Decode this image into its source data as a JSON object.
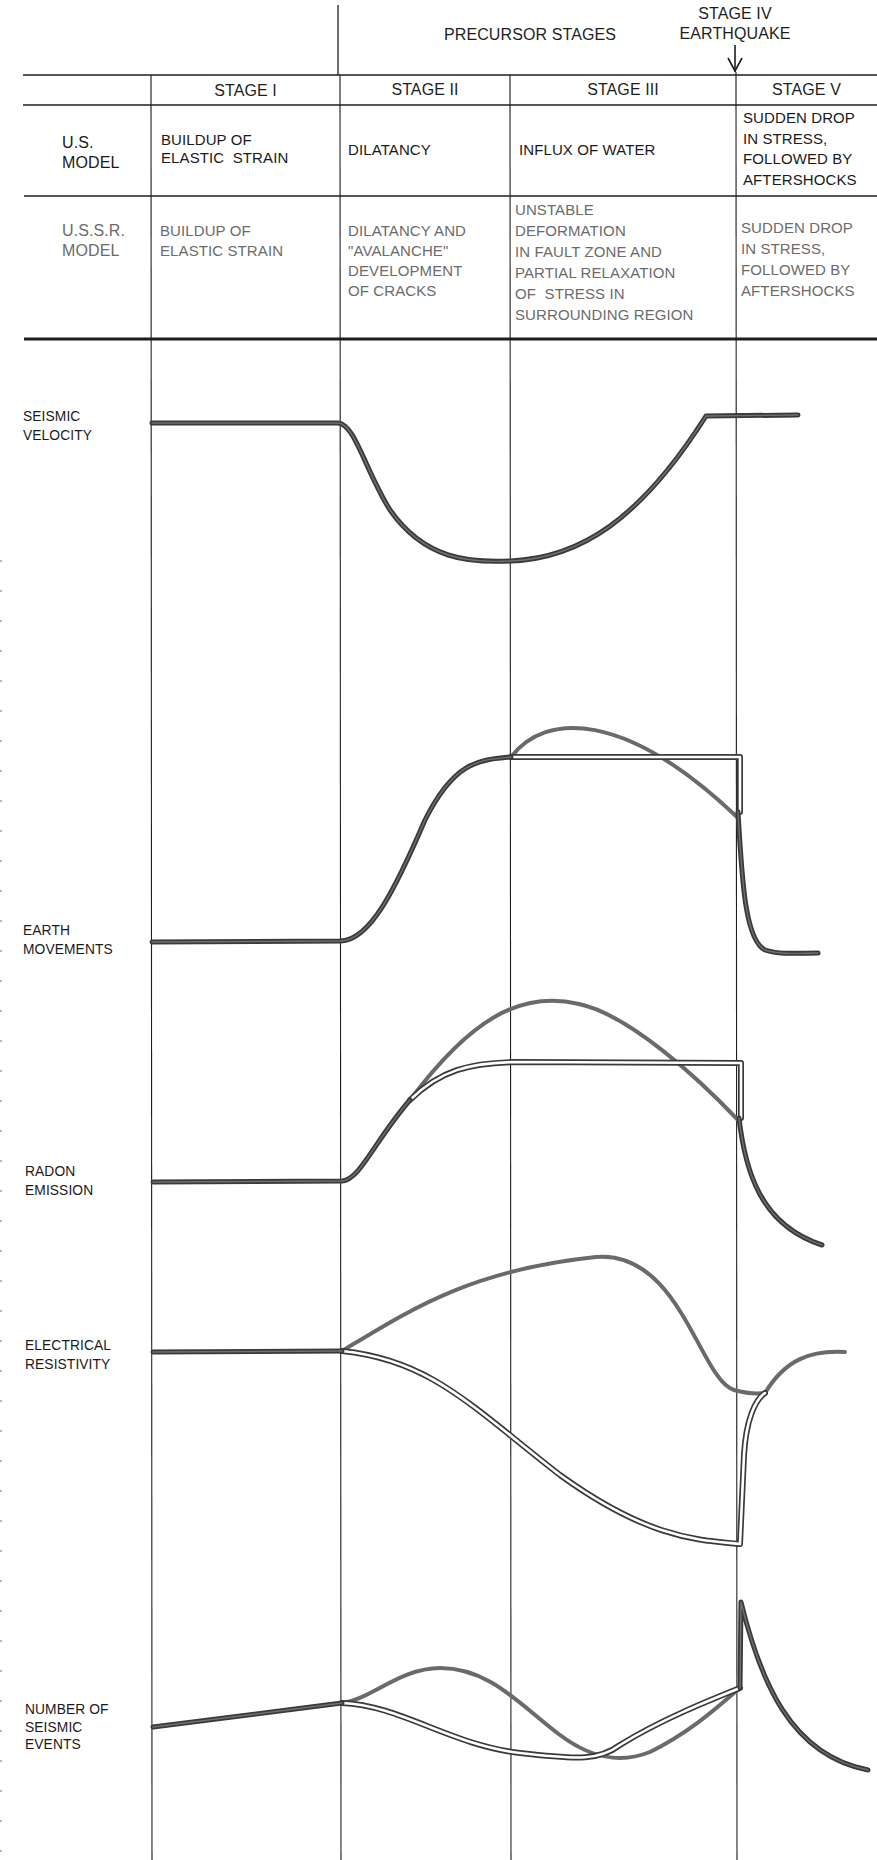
{
  "header": {
    "precursor_label": "PRECURSOR STAGES",
    "stage_iv_line1": "STAGE IV",
    "stage_iv_line2": "EARTHQUAKE",
    "arrow_icon": "down-arrow"
  },
  "table": {
    "stage_headers": [
      "STAGE I",
      "STAGE II",
      "STAGE III",
      "STAGE V"
    ],
    "rows": [
      {
        "model": "U.S.\nMODEL",
        "cells": [
          "BUILDUP OF\nELASTIC  STRAIN",
          "DILATANCY",
          "INFLUX OF WATER",
          "SUDDEN DROP\nIN STRESS,\nFOLLOWED BY\nAFTERSHOCKS"
        ]
      },
      {
        "model": "U.S.S.R.\nMODEL",
        "cells": [
          "BUILDUP OF\nELASTIC STRAIN",
          "DILATANCY AND\n\"AVALANCHE\"\nDEVELOPMENT\nOF CRACKS",
          "UNSTABLE\nDEFORMATION\nIN FAULT ZONE AND\nPARTIAL RELAXATION\nOF  STRESS IN\nSURROUNDING REGION",
          "SUDDEN DROP\nIN STRESS,\nFOLLOWED BY\nAFTERSHOCKS"
        ]
      }
    ]
  },
  "parameters": [
    {
      "label": "SEISMIC\nVELOCITY"
    },
    {
      "label": "EARTH\nMOVEMENTS"
    },
    {
      "label": "RADON\nEMISSION"
    },
    {
      "label": "ELECTRICAL\nRESISTIVITY"
    },
    {
      "label": "NUMBER OF\nSEISMIC\nEVENTS"
    }
  ],
  "colors": {
    "ink": "#1e1e1e",
    "us_curve": "#6a6a6a",
    "shared_curve": "#3a3a3a",
    "ussr_text": "#6b6b6b"
  },
  "chart_data": {
    "type": "line",
    "x_stages": [
      "STAGE I",
      "STAGE II",
      "STAGE III",
      "STAGE IV (EARTHQUAKE)",
      "STAGE V"
    ],
    "stage_boundaries_px": [
      152,
      341,
      511,
      737
    ],
    "legend": {
      "shared": "thick dark line (both models)",
      "us_model": "solid gray line",
      "ussr_model": "double (outlined) line"
    },
    "series": [
      {
        "name": "SEISMIC VELOCITY",
        "shared_path": "M152,423 L338,423 C355,424 365,470 390,510 C425,560 470,563 511,561 C580,558 640,520 706,416 L798,415"
      },
      {
        "name": "EARTH MOVEMENTS",
        "shared_path": "M152,942 L341,941 C370,940 395,890 425,820 C455,760 480,760 511,757",
        "us_path": "M511,757 C545,712 625,710 738,818",
        "ussr_path": "M511,757 L740,757 L740,812",
        "after_path": "M738,812 C742,880 745,940 765,950 C780,955 800,953 818,953"
      },
      {
        "name": "RADON EMISSION",
        "shared_path": "M153,1182 L342,1181 C360,1180 375,1140 410,1100",
        "us_path": "M410,1100 C470,1020 520,990 579,1004 C630,1015 700,1080 738,1120",
        "ussr_path": "M410,1100 C440,1070 470,1063 515,1062 L741,1063 L741,1118",
        "after_path": "M739,1118 C745,1170 760,1225 822,1245"
      },
      {
        "name": "ELECTRICAL RESISTIVITY",
        "shared_path": "M153,1352 L342,1351",
        "us_path": "M342,1351 C410,1310 470,1270 596,1257 C680,1250 700,1380 734,1390 C745,1393 758,1394 765,1393 C785,1360 810,1350 845,1352",
        "ussr_path": "M342,1351 C430,1360 470,1405 560,1475 C650,1540 700,1540 740,1544 L744,1455 C746,1420 755,1400 765,1393"
      },
      {
        "name": "NUMBER OF SEISMIC EVENTS",
        "shared_path": "M153,1727 L342,1703",
        "us_path": "M342,1703 C370,1700 400,1668 440,1668 C490,1668 520,1705 560,1735 C600,1765 630,1760 650,1752 C695,1730 725,1700 740,1688",
        "ussr_path": "M342,1703 C400,1705 450,1745 520,1753 C580,1760 600,1760 620,1745 C660,1720 710,1700 740,1688",
        "after_path": "M740,1688 L741,1602 C760,1680 790,1755 868,1770"
      }
    ]
  }
}
